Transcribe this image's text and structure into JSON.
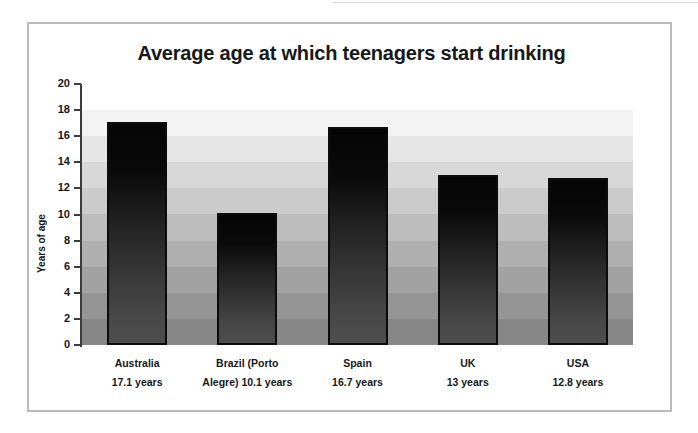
{
  "figure": {
    "title": "Average age at which teenagers start drinking",
    "frame_color": "#b9babc",
    "background": "#ffffff"
  },
  "chart_data": {
    "type": "bar",
    "title": "Average age at which teenagers start drinking",
    "xlabel": "",
    "ylabel": "Years of age",
    "ylim": [
      0,
      20
    ],
    "ytick_step": 2,
    "yticks": [
      20,
      18,
      16,
      14,
      12,
      10,
      8,
      6,
      4,
      2,
      0
    ],
    "ytick_labels": [
      "20",
      "18",
      "16",
      "14",
      "12",
      "10",
      "8",
      "6",
      "4",
      "2",
      "0"
    ],
    "grid": false,
    "legend": "none",
    "plot_background": "banded-gray-gradient",
    "bar_fill": "black-to-gray-vertical-gradient",
    "bar_edge_color": "#0b0c0c",
    "categories": [
      "Australia",
      "Brazil (Porto Alegre)",
      "Spain",
      "UK",
      "USA"
    ],
    "values": [
      17.1,
      10.1,
      16.7,
      13,
      12.8
    ],
    "value_labels": [
      "17.1 years",
      "10.1 years",
      "16.7 years",
      "13 years",
      "12.8 years"
    ],
    "category_label_lines": [
      [
        "Australia",
        "17.1 years"
      ],
      [
        "Brazil (Porto",
        "Alegre) 10.1 years"
      ],
      [
        "Spain",
        "16.7 years"
      ],
      [
        "UK",
        "13 years"
      ],
      [
        "USA",
        "12.8 years"
      ]
    ]
  }
}
